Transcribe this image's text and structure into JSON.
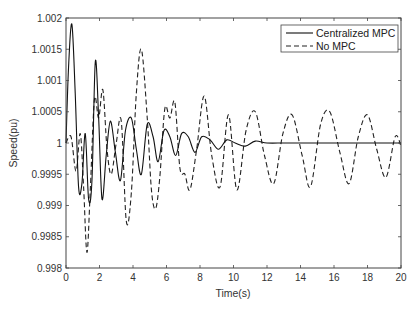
{
  "chart_data": {
    "type": "line",
    "title": "",
    "xlabel": "Time(s)",
    "ylabel": "Speed(pu)",
    "xlim": [
      0,
      20
    ],
    "ylim": [
      0.998,
      1.002
    ],
    "xticks": [
      0,
      2,
      4,
      6,
      8,
      10,
      12,
      14,
      16,
      18,
      20
    ],
    "yticks": [
      0.998,
      0.9985,
      0.999,
      0.9995,
      1,
      1.0005,
      1.001,
      1.0015,
      1.002
    ],
    "xtick_labels": [
      "0",
      "2",
      "4",
      "6",
      "8",
      "10",
      "12",
      "14",
      "16",
      "18",
      "20"
    ],
    "ytick_labels": [
      "0.998",
      "0.9985",
      "0.999",
      "0.9995",
      "1",
      "1.0005",
      "1.001",
      "1.0015",
      "1.002"
    ],
    "grid": false,
    "legend_position": "upper right",
    "series": [
      {
        "name": "Centralized MPC",
        "style": "solid",
        "color": "#000000",
        "x": [
          0,
          0.15,
          0.35,
          0.55,
          0.75,
          0.95,
          1.15,
          1.35,
          1.55,
          1.75,
          1.95,
          2.15,
          2.4,
          2.65,
          2.95,
          3.25,
          3.55,
          3.9,
          4.2,
          4.5,
          4.85,
          5.2,
          5.5,
          5.85,
          6.2,
          6.55,
          6.9,
          7.3,
          7.7,
          8.1,
          8.6,
          9.1,
          9.6,
          10.1,
          10.7,
          11.3,
          12,
          13,
          14,
          15,
          16,
          17,
          18,
          19,
          20
        ],
        "y": [
          1.0,
          1.0012,
          1.0019,
          1.0008,
          0.9993,
          0.99935,
          1.00015,
          0.9991,
          0.9994,
          1.0013,
          1.0004,
          0.9991,
          0.9998,
          1.00035,
          0.99985,
          0.9994,
          1.0002,
          1.0004,
          0.9999,
          0.9995,
          1.0003,
          1.0001,
          0.9997,
          1.0002,
          1.0001,
          0.9998,
          1.00015,
          1.0001,
          0.99985,
          1.0001,
          1.00005,
          0.9999,
          1.00005,
          1.0,
          0.99995,
          1.00003,
          1.0,
          1.0,
          1.0,
          1.0,
          1.0,
          1.0,
          1.0,
          1.0,
          1.0
        ]
      },
      {
        "name": "No MPC",
        "style": "dashed",
        "color": "#000000",
        "x": [
          0,
          0.3,
          0.6,
          0.85,
          1.05,
          1.25,
          1.45,
          1.7,
          1.95,
          2.2,
          2.45,
          2.7,
          3.0,
          3.3,
          3.6,
          3.9,
          4.2,
          4.5,
          4.85,
          5.1,
          5.35,
          5.6,
          5.9,
          6.2,
          6.5,
          6.8,
          7.1,
          7.4,
          7.8,
          8.25,
          8.7,
          9.2,
          9.7,
          10.2,
          10.75,
          11.3,
          11.85,
          12.4,
          12.95,
          13.5,
          14.1,
          14.6,
          15.2,
          15.75,
          16.35,
          16.9,
          17.45,
          18.0,
          18.55,
          19.1,
          19.65,
          20.0
        ],
        "y": [
          1.0,
          1.0001,
          0.99955,
          1.00015,
          0.9993,
          0.99825,
          0.99925,
          1.0007,
          1.0004,
          1.00085,
          0.9999,
          0.9995,
          1.0,
          1.00035,
          0.99875,
          0.9992,
          1.0008,
          1.0015,
          1.0004,
          0.99925,
          0.99895,
          0.99945,
          1.00055,
          1.0004,
          1.00065,
          0.9996,
          0.9995,
          0.99925,
          0.9999,
          1.00075,
          0.9998,
          0.9993,
          1.00045,
          0.99925,
          1.0002,
          1.0005,
          0.9998,
          0.99935,
          1.00015,
          1.00045,
          0.9998,
          0.9993,
          1.0003,
          1.0005,
          0.99985,
          0.99935,
          1.0001,
          1.00045,
          0.9999,
          0.99945,
          1.0001,
          0.99995
        ]
      }
    ]
  },
  "legend": {
    "items": [
      {
        "label": "Centralized MPC",
        "style": "solid"
      },
      {
        "label": "No MPC",
        "style": "dashed"
      }
    ]
  },
  "axes": {
    "xlabel": "Time(s)",
    "ylabel": "Speed(pu)"
  }
}
